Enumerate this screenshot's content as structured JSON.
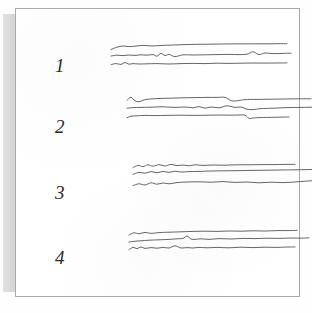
{
  "document": {
    "kind": "scanned-figure-page",
    "page_background": "#ffffff",
    "sheet_border_color": "#a9a9a9",
    "binding_strip_color": "#d9d9d9",
    "trace_ink_color": "#5e5e5e",
    "label_ink_color": "#2b2b2b"
  },
  "caption": {
    "text": "",
    "visible": false
  },
  "chart_data": {
    "type": "line",
    "title": "",
    "xlabel": "",
    "ylabel": "",
    "grid": false,
    "legend": "none",
    "groups": [
      {
        "label": "1",
        "label_x": 40,
        "label_y": 48,
        "traces_x": 96,
        "traces_y": 32,
        "width": 180,
        "height": 40,
        "series": [
          {
            "name": "1-a",
            "x": [
              0,
              6,
              12,
              18,
              24,
              32,
              40,
              50,
              62,
              74,
              86,
              98,
              110,
              122,
              134,
              146,
              158,
              168,
              176
            ],
            "y": [
              9.5,
              7.2,
              6.0,
              6.6,
              6.2,
              5.4,
              6.0,
              5.5,
              5.0,
              4.6,
              4.3,
              4.2,
              4.0,
              3.9,
              3.9,
              3.8,
              3.8,
              3.7,
              3.7
            ]
          },
          {
            "name": "1-b",
            "x": [
              0,
              6,
              12,
              18,
              24,
              30,
              36,
              42,
              46,
              50,
              54,
              58,
              64,
              72,
              82,
              94,
              106,
              118,
              128,
              136,
              142,
              148,
              154,
              162,
              172,
              180
            ],
            "y": [
              16.0,
              15.2,
              15.6,
              15.0,
              15.4,
              14.8,
              15.2,
              14.6,
              16.2,
              13.4,
              15.6,
              14.4,
              16.6,
              14.8,
              15.0,
              14.8,
              14.6,
              14.4,
              14.6,
              14.2,
              11.8,
              14.6,
              13.0,
              13.6,
              13.4,
              13.2
            ]
          },
          {
            "name": "1-c",
            "x": [
              0,
              5,
              10,
              14,
              18,
              22,
              28,
              36,
              46,
              58,
              70,
              82,
              94,
              106,
              118,
              130,
              142,
              154,
              166,
              176
            ],
            "y": [
              24.6,
              23.6,
              24.4,
              22.6,
              24.2,
              23.6,
              24.0,
              23.8,
              23.6,
              24.0,
              23.6,
              23.4,
              23.6,
              23.2,
              23.4,
              23.2,
              23.0,
              23.1,
              23.0,
              22.9
            ]
          }
        ]
      },
      {
        "label": "2",
        "label_x": 40,
        "label_y": 109,
        "traces_x": 112,
        "traces_y": 86,
        "width": 180,
        "height": 42,
        "series": [
          {
            "name": "2-a",
            "x": [
              0,
              4,
              8,
              12,
              16,
              20,
              26,
              34,
              44,
              56,
              68,
              80,
              90,
              98,
              104,
              110,
              118,
              130,
              144,
              158,
              172,
              184
            ],
            "y": [
              6.2,
              3.4,
              6.8,
              7.8,
              6.2,
              5.4,
              4.8,
              4.4,
              4.2,
              3.8,
              3.6,
              3.4,
              3.4,
              3.4,
              6.6,
              6.8,
              5.6,
              5.4,
              5.2,
              5.0,
              4.8,
              4.8
            ]
          },
          {
            "name": "2-b",
            "x": [
              0,
              6,
              14,
              24,
              36,
              48,
              58,
              66,
              72,
              78,
              84,
              92,
              100,
              108,
              114,
              120,
              126,
              134,
              146,
              160,
              174,
              186
            ],
            "y": [
              14.2,
              13.6,
              13.4,
              13.2,
              12.8,
              13.4,
              13.0,
              13.8,
              12.6,
              14.2,
              13.0,
              13.8,
              11.8,
              13.4,
              13.0,
              15.2,
              15.6,
              14.6,
              14.2,
              13.6,
              13.4,
              13.2
            ]
          },
          {
            "name": "2-c",
            "x": [
              0,
              4,
              10,
              18,
              28,
              40,
              54,
              68,
              82,
              94,
              104,
              112,
              118,
              122,
              126,
              132,
              142,
              152,
              162
            ],
            "y": [
              23.8,
              22.2,
              21.8,
              21.4,
              21.6,
              21.4,
              21.2,
              21.4,
              21.2,
              21.0,
              21.2,
              21.0,
              21.2,
              24.4,
              24.0,
              23.6,
              23.4,
              23.2,
              23.0
            ]
          }
        ]
      },
      {
        "label": "3",
        "label_x": 40,
        "label_y": 175,
        "traces_x": 118,
        "traces_y": 152,
        "width": 185,
        "height": 44,
        "series": [
          {
            "name": "3-a",
            "x": [
              0,
              5,
              10,
              15,
              20,
              26,
              32,
              38,
              44,
              50,
              56,
              62,
              70,
              80,
              92,
              104,
              116,
              128,
              140,
              152,
              162
            ],
            "y": [
              7.6,
              5.4,
              6.6,
              4.8,
              6.2,
              4.6,
              6.0,
              4.4,
              5.6,
              5.0,
              5.8,
              4.8,
              5.4,
              5.0,
              5.2,
              4.8,
              4.8,
              4.6,
              4.6,
              4.4,
              4.4
            ]
          },
          {
            "name": "3-b",
            "x": [
              0,
              6,
              12,
              18,
              24,
              30,
              36,
              42,
              48,
              56,
              66,
              78,
              92,
              106,
              120,
              134,
              148,
              162,
              174,
              184
            ],
            "y": [
              14.4,
              12.4,
              13.2,
              11.6,
              12.8,
              11.4,
              12.4,
              11.2,
              12.0,
              11.6,
              11.4,
              11.0,
              10.8,
              10.6,
              10.4,
              10.2,
              10.0,
              9.8,
              9.6,
              9.4
            ]
          },
          {
            "name": "3-c",
            "x": [
              0,
              6,
              12,
              18,
              24,
              30,
              36,
              44,
              54,
              66,
              78,
              90,
              102,
              114,
              126,
              138,
              150,
              162,
              172,
              182
            ],
            "y": [
              25.6,
              23.8,
              25.0,
              22.8,
              24.2,
              23.0,
              23.8,
              22.6,
              22.0,
              21.8,
              22.2,
              21.6,
              22.4,
              22.0,
              22.8,
              22.2,
              22.6,
              22.0,
              21.2,
              20.6
            ]
          }
        ]
      },
      {
        "label": "4",
        "label_x": 40,
        "label_y": 240,
        "traces_x": 114,
        "traces_y": 218,
        "width": 180,
        "height": 44,
        "series": [
          {
            "name": "4-a",
            "x": [
              0,
              5,
              10,
              16,
              22,
              30,
              40,
              52,
              64,
              76,
              88,
              100,
              112,
              124,
              136,
              148,
              158,
              168
            ],
            "y": [
              9.0,
              6.8,
              7.8,
              6.4,
              7.4,
              6.6,
              6.2,
              5.8,
              5.4,
              5.2,
              5.4,
              5.0,
              5.2,
              4.8,
              5.0,
              4.6,
              4.6,
              4.4
            ]
          },
          {
            "name": "4-b",
            "x": [
              0,
              6,
              12,
              20,
              30,
              40,
              48,
              54,
              58,
              62,
              66,
              72,
              80,
              90,
              102,
              114,
              126,
              138,
              150,
              162,
              172,
              180
            ],
            "y": [
              16.0,
              15.2,
              14.8,
              14.2,
              13.8,
              13.4,
              12.8,
              12.4,
              10.0,
              13.0,
              13.4,
              12.8,
              13.4,
              12.6,
              13.0,
              12.4,
              12.6,
              12.2,
              12.4,
              12.0,
              12.2,
              11.8
            ]
          },
          {
            "name": "4-c",
            "x": [
              0,
              4,
              8,
              12,
              16,
              22,
              28,
              34,
              40,
              46,
              52,
              58,
              64,
              70,
              78,
              88,
              100,
              112,
              124,
              136,
              148,
              158,
              166
            ],
            "y": [
              23.6,
              21.4,
              22.6,
              21.0,
              22.4,
              21.6,
              22.2,
              21.4,
              22.0,
              19.8,
              22.0,
              21.6,
              22.0,
              21.4,
              21.8,
              21.4,
              21.8,
              21.2,
              21.6,
              21.2,
              21.4,
              21.0,
              21.0
            ]
          }
        ]
      }
    ]
  }
}
